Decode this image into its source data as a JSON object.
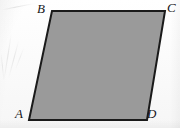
{
  "figure": {
    "caption": "Parallelogram ABCD",
    "shape_name": "parallelogram",
    "fill_color": "#9a9a9a",
    "stroke_color": "#1a1a1a",
    "stroke_width": 2,
    "background_color": "#fbfbfb",
    "vertices": [
      {
        "id": "A",
        "label": "A",
        "x": 29,
        "y": 120,
        "label_x": 15,
        "label_y": 107,
        "position": "bottom-left"
      },
      {
        "id": "B",
        "label": "B",
        "x": 52,
        "y": 11,
        "label_x": 37,
        "label_y": 2,
        "position": "top-left"
      },
      {
        "id": "C",
        "label": "C",
        "x": 165,
        "y": 11,
        "label_x": 167,
        "label_y": 1,
        "position": "top-right"
      },
      {
        "id": "D",
        "label": "D",
        "x": 147,
        "y": 120,
        "label_x": 147,
        "label_y": 107,
        "position": "bottom-right"
      }
    ],
    "edges": [
      {
        "id": "AB",
        "from": "A",
        "to": "B"
      },
      {
        "id": "BC",
        "from": "B",
        "to": "C"
      },
      {
        "id": "CD",
        "from": "C",
        "to": "D"
      },
      {
        "id": "DA",
        "from": "D",
        "to": "A"
      }
    ],
    "polygon_points": "52,11 165,11 147,120 29,120"
  },
  "canvas": {
    "width": 180,
    "height": 128
  }
}
